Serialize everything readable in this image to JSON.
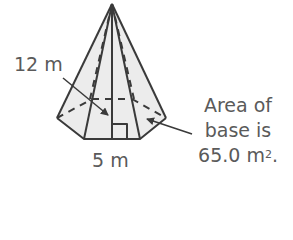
{
  "figure": {
    "type": "regular pentagonal pyramid",
    "colors": {
      "stroke": "#3a3a3a",
      "fill": "#eaeaea",
      "text": "#5a5a5a"
    }
  },
  "labels": {
    "slant_height": "12 m",
    "base_edge": "5 m",
    "base_area": {
      "line1": "Area of",
      "line2": "base is",
      "line3_value": "65.0 m",
      "line3_exponent": "2",
      "line3_suffix": "."
    }
  }
}
